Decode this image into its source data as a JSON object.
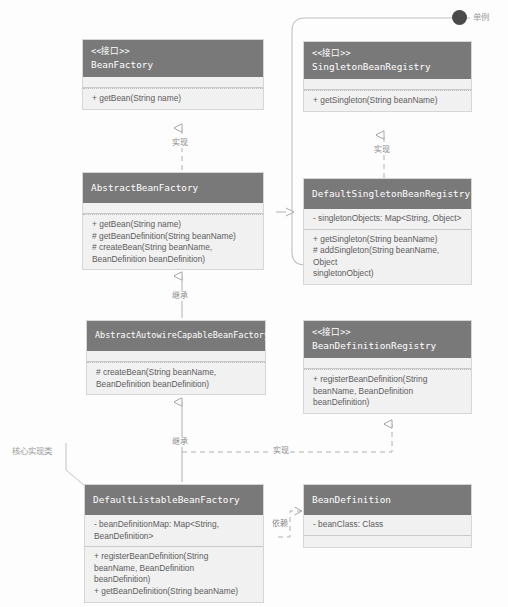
{
  "diagram": {
    "type": "uml-class-diagram",
    "stereotype_interface": "<<接口>>",
    "classes": [
      {
        "id": "bean-factory",
        "name": "BeanFactory",
        "is_interface": true,
        "stereotype": "<<接口>>",
        "attributes": [],
        "methods": [
          "+ getBean(String name)"
        ]
      },
      {
        "id": "singleton-bean-registry",
        "name": "SingletonBeanRegistry",
        "is_interface": true,
        "stereotype": "<<接口>>",
        "attributes": [],
        "methods": [
          "+ getSingleton(String beanName)"
        ]
      },
      {
        "id": "abstract-bean-factory",
        "name": "AbstractBeanFactory",
        "is_interface": false,
        "stereotype": "",
        "attributes": [],
        "methods": [
          "+ getBean(String name)",
          "# getBeanDefinition(String beanName)",
          "# createBean(String beanName,\nBeanDefinition beanDefinition)"
        ]
      },
      {
        "id": "default-singleton-bean-registry",
        "name": "DefaultSingletonBeanRegistry",
        "is_interface": false,
        "stereotype": "",
        "attributes": [
          "- singletonObjects: Map<String, Object>"
        ],
        "methods": [
          "+ getSingleton(String beanName)",
          "# addSingleton(String beanName, Object\nsingletonObject)"
        ]
      },
      {
        "id": "abstract-autowire-capable-bean-factory",
        "name": "AbstractAutowireCapableBeanFactory",
        "is_interface": false,
        "stereotype": "",
        "attributes": [],
        "methods": [
          "# createBean(String beanName,\nBeanDefinition beanDefinition)"
        ]
      },
      {
        "id": "bean-definition-registry",
        "name": "BeanDefinitionRegistry",
        "is_interface": true,
        "stereotype": "<<接口>>",
        "attributes": [],
        "methods": [
          "+ registerBeanDefinition(String\nbeanName, BeanDefinition\nbeanDefinition)"
        ]
      },
      {
        "id": "default-listable-bean-factory",
        "name": "DefaultListableBeanFactory",
        "is_interface": false,
        "stereotype": "",
        "attributes": [
          "- beanDefinitionMap: Map<String,\nBeanDefinition>"
        ],
        "methods": [
          "+ registerBeanDefinition(String\nbeanName, BeanDefinition\nbeanDefinition)",
          "+ getBeanDefinition(String beanName)"
        ]
      },
      {
        "id": "bean-definition",
        "name": "BeanDefinition",
        "is_interface": false,
        "stereotype": "",
        "attributes": [
          "- beanClass: Class"
        ],
        "methods": []
      }
    ],
    "relations": [
      {
        "id": "rel-abf-implements-bf",
        "label": "实现",
        "kind": "realization"
      },
      {
        "id": "rel-dsbr-implements-sbr",
        "label": "实现",
        "kind": "realization"
      },
      {
        "id": "rel-abf-extends-dsbr",
        "label": "继承",
        "kind": "generalization"
      },
      {
        "id": "rel-aacbf-extends-abf",
        "label": "继承",
        "kind": "generalization"
      },
      {
        "id": "rel-dlbf-extends-aacbf",
        "label": "继承",
        "kind": "generalization"
      },
      {
        "id": "rel-dlbf-implements-bdr",
        "label": "实现",
        "kind": "realization"
      },
      {
        "id": "rel-dlbf-depends-bd",
        "label": "依赖",
        "kind": "dependency"
      }
    ],
    "annotations": [
      {
        "id": "singleton-group",
        "label": "单例"
      },
      {
        "id": "core-impl-class",
        "label": "核心实现类"
      }
    ],
    "colors": {
      "header_fill": "#797979",
      "header_text": "#ffffff",
      "body_fill": "#f1f1f1",
      "border": "#d6d6d6",
      "line": "#b0b0b0",
      "label_text": "#8a8a8a",
      "dot_fill": "#4a4a4a"
    }
  }
}
